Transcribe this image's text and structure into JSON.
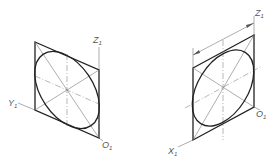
{
  "figures": [
    {
      "id": "left-view",
      "description": "Isometric ellipse inscribed in rhombus on YZ plane",
      "labels": {
        "z_axis": "Z",
        "z_axis_sub": "1",
        "y_axis": "Y",
        "y_axis_sub": "1",
        "origin": "O",
        "origin_sub": "1"
      }
    },
    {
      "id": "right-view",
      "description": "Isometric ellipse inscribed in rhombus on XZ plane with dimension line",
      "labels": {
        "z_axis": "Z",
        "z_axis_sub": "1",
        "x_axis": "X",
        "x_axis_sub": "1",
        "origin": "O",
        "origin_sub": "1"
      }
    }
  ],
  "colors": {
    "outline": "#222222",
    "construction": "#777777",
    "label": "#555555"
  }
}
